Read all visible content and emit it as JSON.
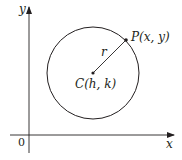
{
  "diagram": {
    "title": "",
    "axes": {
      "x_label": "x",
      "y_label": "y",
      "origin_label": "0"
    },
    "circle": {
      "center_label": "C(h, k)",
      "point_label": "P(x, y)",
      "radius_label": "r"
    },
    "colors": {
      "stroke": "#231f20",
      "background": "#ffffff"
    }
  }
}
